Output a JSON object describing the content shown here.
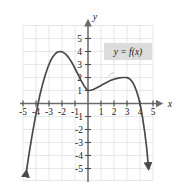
{
  "figure": {
    "background_color": "#ffffff",
    "grid_color": "#d9dde3",
    "axis_color": "#6b6b6b",
    "curve_color": "#4a4a4a",
    "callout_fill": "#dcdcdc",
    "text_color": "#1a1a1a"
  },
  "axes": {
    "x_name": "x",
    "y_name": "y",
    "x_ticks": [
      "-5",
      "-4",
      "-3",
      "-2",
      "-1",
      "1",
      "2",
      "3",
      "4",
      "5"
    ],
    "y_ticks": [
      "5",
      "4",
      "3",
      "2",
      "1",
      "-1",
      "-2",
      "-3",
      "-4",
      "-5"
    ]
  },
  "annotations": {
    "function_label": "y = f(x)"
  },
  "chart_data": {
    "type": "line",
    "title": "",
    "xlabel": "x",
    "ylabel": "y",
    "xlim": [
      -5.6,
      5.6
    ],
    "ylim": [
      -5.8,
      5.8
    ],
    "grid": true,
    "legend": "none",
    "annotations": [
      {
        "text": "y = f(x)",
        "x": 2.9,
        "y": 3.6
      }
    ],
    "xticks": [
      -5,
      -4,
      -3,
      -2,
      -1,
      1,
      2,
      3,
      4,
      5
    ],
    "yticks": [
      5,
      4,
      3,
      2,
      1,
      -1,
      -2,
      -3,
      -4,
      -5
    ],
    "series": [
      {
        "name": "f(x)",
        "color": "#4a4a4a",
        "arrow_start": true,
        "arrow_end": true,
        "key_points": {
          "local_max_left": [
            -2,
            4
          ],
          "local_min_middle": [
            0,
            1
          ],
          "local_max_right": [
            3,
            2
          ],
          "x_intercepts": [
            -4,
            4.1
          ]
        },
        "x": [
          -4.75,
          -4.6,
          -4.45,
          -4.3,
          -4.15,
          -4.0,
          -3.85,
          -3.7,
          -3.5,
          -3.3,
          -3.1,
          -2.9,
          -2.7,
          -2.5,
          -2.3,
          -2.1,
          -2.0,
          -1.9,
          -1.7,
          -1.5,
          -1.3,
          -1.1,
          -0.9,
          -0.7,
          -0.5,
          -0.3,
          -0.15,
          0.0,
          0.2,
          0.4,
          0.6,
          0.9,
          1.2,
          1.5,
          1.8,
          2.1,
          2.4,
          2.7,
          2.9,
          3.0,
          3.15,
          3.3,
          3.45,
          3.6,
          3.75,
          3.9,
          4.05,
          4.2,
          4.35,
          4.5,
          4.65
        ],
        "y": [
          -5.3,
          -4.3,
          -3.35,
          -2.45,
          -1.6,
          -0.8,
          -0.05,
          0.65,
          1.45,
          2.15,
          2.75,
          3.25,
          3.6,
          3.85,
          3.98,
          4.0,
          3.98,
          3.93,
          3.78,
          3.55,
          3.25,
          2.9,
          2.5,
          2.1,
          1.7,
          1.35,
          1.15,
          1.0,
          1.02,
          1.08,
          1.17,
          1.33,
          1.5,
          1.66,
          1.8,
          1.9,
          1.97,
          2.0,
          2.0,
          1.99,
          1.93,
          1.8,
          1.6,
          1.3,
          0.9,
          0.4,
          -0.25,
          -1.1,
          -2.1,
          -3.3,
          -4.9
        ]
      }
    ]
  }
}
